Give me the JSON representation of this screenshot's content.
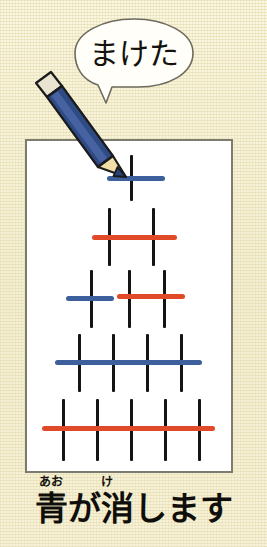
{
  "scene": {
    "width": 267,
    "height": 547,
    "background_color": "#f7f3d8",
    "paper_color": "#ffffff",
    "paper_border_color": "#7c7b70"
  },
  "speech_bubble": {
    "text": "まけた",
    "fill_color": "#fffef8",
    "outline_color": "#6e6b5e"
  },
  "pencil": {
    "body_color": "#2f4b86",
    "body_highlight_color": "#4a66a4",
    "wood_color": "#f2dfa8",
    "tip_color": "#2a4378",
    "ferrule_color": "#e8e4d0",
    "outline_color": "#1b1b1b"
  },
  "colors": {
    "blue": "#3d5f9c",
    "red": "#e04a28",
    "mark_black": "#141414"
  },
  "tally_chart": {
    "description": "Five rows of vertical tally marks struck through with blue and red horizontal strokes",
    "rows": [
      {
        "row_index": 1,
        "mark_count": 1,
        "marks_x": [
          130
        ],
        "mark_top": 155,
        "mark_height": 46,
        "strikes": [
          {
            "color": "blue",
            "x": 107,
            "width": 58,
            "y": 176
          }
        ]
      },
      {
        "row_index": 2,
        "mark_count": 2,
        "marks_x": [
          108,
          152
        ],
        "mark_top": 208,
        "mark_height": 58,
        "strikes": [
          {
            "color": "red",
            "x": 92,
            "width": 85,
            "y": 235
          }
        ]
      },
      {
        "row_index": 3,
        "mark_count": 3,
        "marks_x": [
          90,
          128,
          163
        ],
        "mark_top": 270,
        "mark_height": 58,
        "strikes": [
          {
            "color": "blue",
            "x": 66,
            "width": 48,
            "y": 296
          },
          {
            "color": "red",
            "x": 117,
            "width": 68,
            "y": 294
          }
        ]
      },
      {
        "row_index": 4,
        "mark_count": 4,
        "marks_x": [
          78,
          112,
          146,
          180
        ],
        "mark_top": 334,
        "mark_height": 58,
        "strikes": [
          {
            "color": "blue",
            "x": 55,
            "width": 147,
            "y": 360
          }
        ]
      },
      {
        "row_index": 5,
        "mark_count": 5,
        "marks_x": [
          62,
          96,
          130,
          164,
          198
        ],
        "mark_top": 399,
        "mark_height": 62,
        "strikes": [
          {
            "color": "red",
            "x": 42,
            "width": 173,
            "y": 426
          }
        ]
      }
    ]
  },
  "caption": {
    "main_text": "青が消します",
    "furigana_ao": "あお",
    "furigana_ke": "け",
    "text_color": "#100e0b"
  }
}
